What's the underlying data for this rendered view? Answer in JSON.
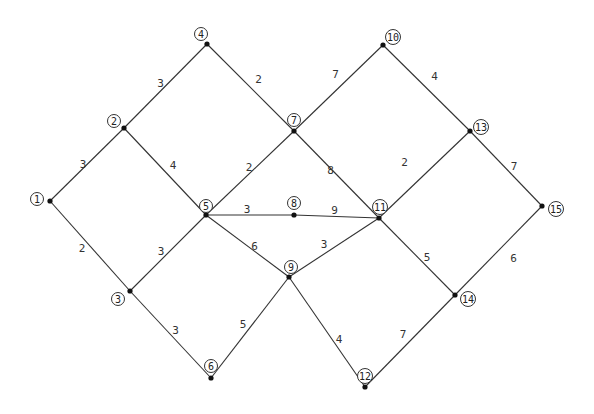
{
  "diagram": {
    "type": "weighted-graph",
    "nodes": [
      {
        "id": "1"
      },
      {
        "id": "2"
      },
      {
        "id": "3"
      },
      {
        "id": "4"
      },
      {
        "id": "5"
      },
      {
        "id": "6"
      },
      {
        "id": "7"
      },
      {
        "id": "8"
      },
      {
        "id": "9"
      },
      {
        "id": "10"
      },
      {
        "id": "11"
      },
      {
        "id": "12"
      },
      {
        "id": "13"
      },
      {
        "id": "14"
      },
      {
        "id": "15"
      }
    ],
    "edges": [
      {
        "from": "1",
        "to": "2",
        "weight": "3"
      },
      {
        "from": "1",
        "to": "3",
        "weight": "2"
      },
      {
        "from": "2",
        "to": "4",
        "weight": "3"
      },
      {
        "from": "2",
        "to": "5",
        "weight": "4"
      },
      {
        "from": "3",
        "to": "5",
        "weight": "3"
      },
      {
        "from": "3",
        "to": "6",
        "weight": "3"
      },
      {
        "from": "4",
        "to": "7",
        "weight": "2"
      },
      {
        "from": "5",
        "to": "7",
        "weight": "2"
      },
      {
        "from": "5",
        "to": "8",
        "weight": "3"
      },
      {
        "from": "5",
        "to": "9",
        "weight": "6"
      },
      {
        "from": "6",
        "to": "9",
        "weight": "5"
      },
      {
        "from": "7",
        "to": "10",
        "weight": "7"
      },
      {
        "from": "7",
        "to": "11",
        "weight": "8"
      },
      {
        "from": "8",
        "to": "11",
        "weight": "9"
      },
      {
        "from": "9",
        "to": "11",
        "weight": "3"
      },
      {
        "from": "9",
        "to": "12",
        "weight": "4"
      },
      {
        "from": "10",
        "to": "13",
        "weight": "4"
      },
      {
        "from": "11",
        "to": "13",
        "weight": "2"
      },
      {
        "from": "11",
        "to": "14",
        "weight": "5"
      },
      {
        "from": "12",
        "to": "14",
        "weight": "7"
      },
      {
        "from": "13",
        "to": "15",
        "weight": "7"
      },
      {
        "from": "14",
        "to": "15",
        "weight": "6"
      }
    ]
  }
}
